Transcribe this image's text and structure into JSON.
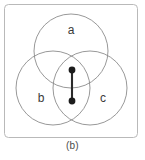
{
  "figure": {
    "caption": "(b)",
    "panel": {
      "x": 4.5,
      "y": 4.5,
      "width": 133,
      "height": 133,
      "rx": 4,
      "stroke_color": "#b9b9b9"
    },
    "circle_stroke_color": "#8c8c8c",
    "edge_color": "#2b2b2b",
    "node_color": "#1c1c1c",
    "label_color": "#3a3a3a",
    "circles": [
      {
        "name": "a",
        "cx": 71,
        "cy": 51,
        "r": 37
      },
      {
        "name": "b",
        "cx": 53,
        "cy": 88,
        "r": 37
      },
      {
        "name": "c",
        "cx": 90,
        "cy": 88,
        "r": 37
      }
    ],
    "labels": [
      {
        "text": "a",
        "x": 71,
        "y": 31
      },
      {
        "text": "b",
        "x": 41,
        "y": 99
      },
      {
        "text": "c",
        "x": 103,
        "y": 99
      }
    ],
    "edge": {
      "x1": 72,
      "y1": 70,
      "x2": 72,
      "y2": 101
    },
    "nodes": [
      {
        "cx": 72,
        "cy": 70,
        "r": 3.4
      },
      {
        "cx": 72,
        "cy": 101,
        "r": 3.4
      }
    ]
  },
  "chart_data": {
    "type": "diagram",
    "title": "(b)",
    "sets": [
      "a",
      "b",
      "c"
    ],
    "graph": {
      "nodes": 2,
      "edges": 1,
      "node_positions": [
        [
          72,
          70
        ],
        [
          72,
          101
        ]
      ],
      "edge_list": [
        [
          0,
          1
        ]
      ]
    }
  }
}
